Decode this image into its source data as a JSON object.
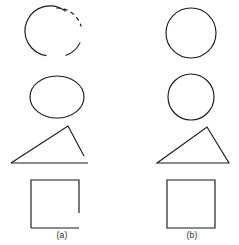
{
  "figure": {
    "width": 239,
    "height": 245,
    "background_color": "#ffffff",
    "stroke_color": "#1a1a1a",
    "stroke_width": 1.15
  },
  "columns": [
    {
      "id": "a",
      "caption": "(a)",
      "caption_x": 62,
      "caption_y": 238,
      "description": "incomplete shapes with gaps and dashed segments",
      "rows": [
        {
          "name": "broken-circle",
          "shape": "circle",
          "complete": false,
          "cx": 57,
          "cy": 33,
          "r": 25,
          "solid_arcs": [
            {
              "start_deg": 115,
              "end_deg": 270
            },
            {
              "start_deg": 22,
              "end_deg": 70
            }
          ],
          "dashed_arcs": [
            {
              "start_deg": 272,
              "end_deg": 345
            }
          ],
          "gaps_deg": [
            {
              "start_deg": 345,
              "end_deg": 22
            },
            {
              "start_deg": 70,
              "end_deg": 115
            }
          ]
        },
        {
          "name": "ellipse",
          "shape": "ellipse",
          "complete": true,
          "cx": 57,
          "cy": 97,
          "rx": 27,
          "ry": 21
        },
        {
          "name": "open-triangle",
          "shape": "triangle",
          "complete": false,
          "vertices": [
            {
              "x": 11,
              "y": 163
            },
            {
              "x": 68,
              "y": 126
            },
            {
              "x": 84,
              "y": 156
            }
          ],
          "baseline": {
            "x1": 11,
            "y1": 163,
            "x2": 88,
            "y2": 163
          },
          "gap_description": "right edge stops above the baseline"
        },
        {
          "name": "open-square",
          "shape": "square",
          "complete": false,
          "x": 31,
          "y": 180,
          "size": 48,
          "gap_description": "right edge stops short of the bottom-right corner",
          "right_edge_stop_y": 213
        }
      ]
    },
    {
      "id": "b",
      "caption": "(b)",
      "caption_x": 192,
      "caption_y": 238,
      "description": "complete closed shapes",
      "rows": [
        {
          "name": "circle",
          "shape": "circle",
          "complete": true,
          "cx": 191,
          "cy": 33,
          "r": 25
        },
        {
          "name": "circle",
          "shape": "circle",
          "complete": true,
          "cx": 191,
          "cy": 97,
          "r": 23
        },
        {
          "name": "closed-triangle",
          "shape": "triangle",
          "complete": true,
          "vertices": [
            {
              "x": 157,
              "y": 163
            },
            {
              "x": 207,
              "y": 127
            },
            {
              "x": 229,
              "y": 163
            }
          ]
        },
        {
          "name": "closed-square",
          "shape": "square",
          "complete": true,
          "x": 167,
          "y": 180,
          "size": 48
        }
      ]
    }
  ],
  "captions": {
    "a": "(a)",
    "b": "(b)"
  }
}
